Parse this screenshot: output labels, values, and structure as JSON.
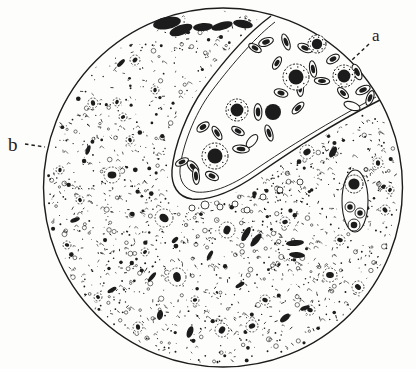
{
  "caption": {
    "text": "Figura 87."
  },
  "labels": {
    "a": {
      "text": "a",
      "x": 372,
      "y": 41,
      "size": 17,
      "leader": [
        369,
        44,
        352,
        60
      ]
    },
    "b": {
      "text": "b",
      "x": 8,
      "y": 151,
      "size": 19,
      "leader": [
        25,
        144,
        45,
        147
      ]
    }
  },
  "colors": {
    "ink": "#1c1c1c",
    "paper": "#fdfdfb"
  },
  "field": {
    "cx": 223,
    "cy": 187.5,
    "r": 179.5
  },
  "vessel": {
    "fill_path": "M271,16 C252,30 228,55 204,88 C187,112 174,146 172,170 C171,186 178,197 192,199 C212,201 235,190 258,174 C290,152 330,125 380,100 A179.5,179.5 0 0 0 271,16 Z",
    "wall_path": "M271,16 C252,30 228,55 204,88 C187,112 174,146 172,170 C171,186 178,197 192,199 C212,201 235,190 258,174 C290,152 330,125 380,100",
    "inner_wall_path": "M275,22 C258,35 235,60 211,92 C194,115 182,147 180,169 C179,181 185,190 196,192 C213,194 235,184 256,169 C287,148 329,122 376,97"
  },
  "erythrocytes": [
    [
      277,
      63,
      -60,
      1
    ],
    [
      305,
      48,
      25,
      1
    ],
    [
      313,
      69,
      80,
      1
    ],
    [
      333,
      59,
      -30,
      1
    ],
    [
      322,
      81,
      5,
      1
    ],
    [
      357,
      72,
      65,
      1
    ],
    [
      343,
      93,
      45,
      1
    ],
    [
      363,
      90,
      -25,
      1
    ],
    [
      300,
      88,
      85,
      1
    ],
    [
      281,
      93,
      15,
      1
    ],
    [
      298,
      108,
      -45,
      1
    ],
    [
      258,
      112,
      88,
      1
    ],
    [
      238,
      131,
      30,
      1
    ],
    [
      252,
      141,
      -50,
      0
    ],
    [
      269,
      133,
      72,
      1
    ],
    [
      203,
      127,
      -35,
      1
    ],
    [
      217,
      133,
      58,
      1
    ],
    [
      241,
      149,
      5,
      1
    ],
    [
      182,
      162,
      -25,
      1
    ],
    [
      193,
      167,
      48,
      1
    ],
    [
      196,
      176,
      85,
      1
    ],
    [
      212,
      176,
      25,
      1
    ],
    [
      370,
      98,
      -70,
      1
    ],
    [
      352,
      106,
      20,
      0
    ],
    [
      255,
      48,
      30,
      1
    ],
    [
      266,
      42,
      -20,
      1
    ],
    [
      286,
      42,
      70,
      1
    ]
  ],
  "leukocytes": [
    [
      296,
      77,
      13
    ],
    [
      344,
      76,
      11
    ],
    [
      317,
      44,
      9
    ],
    [
      237,
      110,
      11
    ],
    [
      215,
      156,
      13
    ]
  ],
  "dark_round_cells": [
    [
      273,
      112,
      8
    ]
  ],
  "capillary": {
    "cx": 355,
    "cy": 201,
    "rx": 13,
    "ry": 31,
    "large_cell": [
      354,
      184,
      9
    ],
    "small_cells": [
      [
        350,
        207,
        5
      ],
      [
        360,
        213,
        5
      ],
      [
        354,
        225,
        6
      ]
    ]
  },
  "tissue_cells": [
    [
      112,
      175,
      8
    ],
    [
      164,
      218,
      9
    ],
    [
      177,
      277,
      9
    ],
    [
      227,
      230,
      8
    ],
    [
      307,
      152,
      7
    ],
    [
      330,
      275,
      7
    ],
    [
      358,
      287,
      6
    ],
    [
      93,
      103,
      5
    ],
    [
      117,
      102,
      4
    ],
    [
      123,
      117,
      4
    ],
    [
      67,
      245,
      4
    ],
    [
      98,
      297,
      4
    ],
    [
      138,
      327,
      5
    ],
    [
      222,
      330,
      7
    ],
    [
      252,
      326,
      6
    ],
    [
      340,
      240,
      5
    ],
    [
      385,
      210,
      5
    ],
    [
      378,
      163,
      5
    ],
    [
      390,
      190,
      4
    ],
    [
      285,
      222,
      5
    ],
    [
      310,
      310,
      5
    ],
    [
      80,
      200,
      4
    ],
    [
      60,
      170,
      4
    ],
    [
      145,
      252,
      4
    ],
    [
      195,
      300,
      4
    ],
    [
      265,
      300,
      5
    ],
    [
      130,
      140,
      4
    ],
    [
      155,
      90,
      4
    ],
    [
      135,
      60,
      5
    ]
  ],
  "dark_blobs": [
    [
      167,
      23,
      6,
      14,
      80
    ],
    [
      181,
      30,
      5,
      12,
      70
    ],
    [
      203,
      27,
      4,
      10,
      85
    ],
    [
      222,
      26,
      4,
      11,
      75
    ],
    [
      243,
      24,
      4,
      10,
      100
    ],
    [
      246,
      234,
      3,
      8,
      30
    ],
    [
      256,
      240,
      3,
      8,
      40
    ],
    [
      295,
      243,
      3,
      9,
      85
    ],
    [
      297,
      255,
      3,
      8,
      95
    ],
    [
      190,
      332,
      3,
      6,
      20
    ],
    [
      285,
      318,
      3,
      6,
      50
    ],
    [
      305,
      308,
      2,
      5,
      70
    ],
    [
      160,
      315,
      3,
      5,
      10
    ],
    [
      152,
      277,
      2,
      6,
      40
    ],
    [
      112,
      290,
      2,
      5,
      60
    ],
    [
      333,
      152,
      3,
      6,
      30
    ],
    [
      121,
      63,
      2,
      5,
      45
    ],
    [
      88,
      150,
      2,
      5,
      20
    ],
    [
      75,
      220,
      2,
      5,
      70
    ],
    [
      210,
      255,
      2,
      5,
      30
    ],
    [
      240,
      285,
      2,
      5,
      60
    ],
    [
      175,
      240,
      2,
      4,
      45
    ]
  ],
  "clear_rings": [
    [
      205,
      205,
      4
    ],
    [
      220,
      207,
      3
    ],
    [
      235,
      204,
      3
    ],
    [
      192,
      208,
      3
    ],
    [
      263,
      197,
      3
    ],
    [
      280,
      190,
      3
    ],
    [
      247,
      210,
      3
    ],
    [
      300,
      182,
      3
    ]
  ],
  "stipple": {
    "seed": 7,
    "count": 2200
  }
}
